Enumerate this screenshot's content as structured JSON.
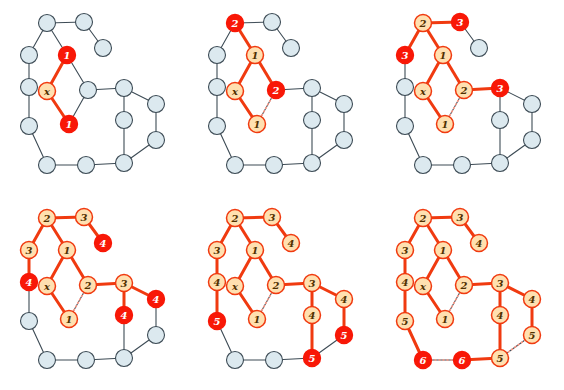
{
  "figure": {
    "panel_count": 6,
    "rows": 2,
    "cols": 3
  },
  "style": {
    "undiscovered_fill": "#dce9ef",
    "undiscovered_stroke": "#3d4b55",
    "discovered_fill": "#ffe0b0",
    "discovered_stroke": "#f03a10",
    "frontier_fill": "#f81807",
    "frontier_stroke": "#f81807",
    "frontier_text": "#ffffff",
    "label_text": "#503000",
    "plain_edge": "#3d4b55",
    "tree_edge": "#f03a10",
    "cross_edge": "#ff9a88",
    "background": "#ffffff",
    "node_radius": 8.5,
    "plain_edge_width": 1.1,
    "tree_edge_width": 3.0,
    "cross_edge_width": 1.6,
    "cross_edge_dash": "1,3"
  },
  "graph": {
    "note": "Shared node layout used by all six panels. Coordinates are panel-local pixels.",
    "nodes": [
      {
        "id": "a",
        "x": 47,
        "y": 23
      },
      {
        "id": "b",
        "x": 84,
        "y": 22
      },
      {
        "id": "c",
        "x": 103,
        "y": 48
      },
      {
        "id": "d",
        "x": 67,
        "y": 55
      },
      {
        "id": "e",
        "x": 29,
        "y": 55
      },
      {
        "id": "f",
        "x": 29,
        "y": 87
      },
      {
        "id": "x",
        "x": 47,
        "y": 91
      },
      {
        "id": "h",
        "x": 88,
        "y": 90
      },
      {
        "id": "i",
        "x": 69,
        "y": 124
      },
      {
        "id": "j",
        "x": 29,
        "y": 126
      },
      {
        "id": "k",
        "x": 124,
        "y": 88
      },
      {
        "id": "l",
        "x": 156,
        "y": 104
      },
      {
        "id": "m",
        "x": 124,
        "y": 120
      },
      {
        "id": "n",
        "x": 156,
        "y": 140
      },
      {
        "id": "o",
        "x": 47,
        "y": 165
      },
      {
        "id": "p",
        "x": 86,
        "y": 165
      },
      {
        "id": "q",
        "x": 124,
        "y": 163
      }
    ],
    "edges": [
      {
        "u": "a",
        "v": "b"
      },
      {
        "u": "a",
        "v": "d"
      },
      {
        "u": "a",
        "v": "e"
      },
      {
        "u": "b",
        "v": "c"
      },
      {
        "u": "d",
        "v": "x"
      },
      {
        "u": "d",
        "v": "h"
      },
      {
        "u": "e",
        "v": "f"
      },
      {
        "u": "f",
        "v": "j"
      },
      {
        "u": "x",
        "v": "i"
      },
      {
        "u": "h",
        "v": "i"
      },
      {
        "u": "h",
        "v": "k"
      },
      {
        "u": "k",
        "v": "l"
      },
      {
        "u": "k",
        "v": "m"
      },
      {
        "u": "l",
        "v": "n"
      },
      {
        "u": "m",
        "v": "q"
      },
      {
        "u": "n",
        "v": "q"
      },
      {
        "u": "j",
        "v": "o"
      },
      {
        "u": "o",
        "v": "p"
      },
      {
        "u": "p",
        "v": "q"
      }
    ]
  },
  "panels": [
    {
      "index": 1,
      "name": "panel-step-1",
      "caption": "",
      "labels": [
        {
          "node": "x",
          "text": "x",
          "state": "discovered"
        },
        {
          "node": "d",
          "text": "1",
          "state": "frontier"
        },
        {
          "node": "i",
          "text": "1",
          "state": "frontier"
        }
      ],
      "tree_edges": [
        [
          "x",
          "d"
        ],
        [
          "x",
          "i"
        ]
      ],
      "cross_edges": []
    },
    {
      "index": 2,
      "name": "panel-step-2",
      "caption": "",
      "labels": [
        {
          "node": "x",
          "text": "x",
          "state": "discovered"
        },
        {
          "node": "d",
          "text": "1",
          "state": "discovered"
        },
        {
          "node": "i",
          "text": "1",
          "state": "discovered"
        },
        {
          "node": "a",
          "text": "2",
          "state": "frontier"
        },
        {
          "node": "h",
          "text": "2",
          "state": "frontier"
        }
      ],
      "tree_edges": [
        [
          "x",
          "d"
        ],
        [
          "x",
          "i"
        ],
        [
          "d",
          "a"
        ],
        [
          "d",
          "h"
        ]
      ],
      "cross_edges": [
        [
          "h",
          "i"
        ]
      ]
    },
    {
      "index": 3,
      "name": "panel-step-3",
      "caption": "",
      "labels": [
        {
          "node": "x",
          "text": "x",
          "state": "discovered"
        },
        {
          "node": "d",
          "text": "1",
          "state": "discovered"
        },
        {
          "node": "i",
          "text": "1",
          "state": "discovered"
        },
        {
          "node": "a",
          "text": "2",
          "state": "discovered"
        },
        {
          "node": "h",
          "text": "2",
          "state": "discovered"
        },
        {
          "node": "b",
          "text": "3",
          "state": "frontier"
        },
        {
          "node": "e",
          "text": "3",
          "state": "frontier"
        },
        {
          "node": "k",
          "text": "3",
          "state": "frontier"
        }
      ],
      "tree_edges": [
        [
          "x",
          "d"
        ],
        [
          "x",
          "i"
        ],
        [
          "d",
          "a"
        ],
        [
          "d",
          "h"
        ],
        [
          "a",
          "b"
        ],
        [
          "a",
          "e"
        ],
        [
          "h",
          "k"
        ]
      ],
      "cross_edges": [
        [
          "h",
          "i"
        ]
      ]
    },
    {
      "index": 4,
      "name": "panel-step-4",
      "caption": "",
      "labels": [
        {
          "node": "x",
          "text": "x",
          "state": "discovered"
        },
        {
          "node": "d",
          "text": "1",
          "state": "discovered"
        },
        {
          "node": "i",
          "text": "1",
          "state": "discovered"
        },
        {
          "node": "a",
          "text": "2",
          "state": "discovered"
        },
        {
          "node": "h",
          "text": "2",
          "state": "discovered"
        },
        {
          "node": "b",
          "text": "3",
          "state": "discovered"
        },
        {
          "node": "e",
          "text": "3",
          "state": "discovered"
        },
        {
          "node": "k",
          "text": "3",
          "state": "discovered"
        },
        {
          "node": "c",
          "text": "4",
          "state": "frontier"
        },
        {
          "node": "f",
          "text": "4",
          "state": "frontier"
        },
        {
          "node": "m",
          "text": "4",
          "state": "frontier"
        },
        {
          "node": "l",
          "text": "4",
          "state": "frontier"
        }
      ],
      "tree_edges": [
        [
          "x",
          "d"
        ],
        [
          "x",
          "i"
        ],
        [
          "d",
          "a"
        ],
        [
          "d",
          "h"
        ],
        [
          "a",
          "b"
        ],
        [
          "a",
          "e"
        ],
        [
          "h",
          "k"
        ],
        [
          "b",
          "c"
        ],
        [
          "e",
          "f"
        ],
        [
          "k",
          "m"
        ],
        [
          "k",
          "l"
        ]
      ],
      "cross_edges": [
        [
          "h",
          "i"
        ]
      ]
    },
    {
      "index": 5,
      "name": "panel-step-5",
      "caption": "",
      "labels": [
        {
          "node": "x",
          "text": "x",
          "state": "discovered"
        },
        {
          "node": "d",
          "text": "1",
          "state": "discovered"
        },
        {
          "node": "i",
          "text": "1",
          "state": "discovered"
        },
        {
          "node": "a",
          "text": "2",
          "state": "discovered"
        },
        {
          "node": "h",
          "text": "2",
          "state": "discovered"
        },
        {
          "node": "b",
          "text": "3",
          "state": "discovered"
        },
        {
          "node": "e",
          "text": "3",
          "state": "discovered"
        },
        {
          "node": "k",
          "text": "3",
          "state": "discovered"
        },
        {
          "node": "c",
          "text": "4",
          "state": "discovered"
        },
        {
          "node": "f",
          "text": "4",
          "state": "discovered"
        },
        {
          "node": "m",
          "text": "4",
          "state": "discovered"
        },
        {
          "node": "l",
          "text": "4",
          "state": "discovered"
        },
        {
          "node": "j",
          "text": "5",
          "state": "frontier"
        },
        {
          "node": "q",
          "text": "5",
          "state": "frontier"
        },
        {
          "node": "n",
          "text": "5",
          "state": "frontier"
        }
      ],
      "tree_edges": [
        [
          "x",
          "d"
        ],
        [
          "x",
          "i"
        ],
        [
          "d",
          "a"
        ],
        [
          "d",
          "h"
        ],
        [
          "a",
          "b"
        ],
        [
          "a",
          "e"
        ],
        [
          "h",
          "k"
        ],
        [
          "b",
          "c"
        ],
        [
          "e",
          "f"
        ],
        [
          "k",
          "m"
        ],
        [
          "k",
          "l"
        ],
        [
          "f",
          "j"
        ],
        [
          "m",
          "q"
        ],
        [
          "l",
          "n"
        ]
      ],
      "cross_edges": [
        [
          "h",
          "i"
        ]
      ]
    },
    {
      "index": 6,
      "name": "panel-step-6",
      "caption": "",
      "labels": [
        {
          "node": "x",
          "text": "x",
          "state": "discovered"
        },
        {
          "node": "d",
          "text": "1",
          "state": "discovered"
        },
        {
          "node": "i",
          "text": "1",
          "state": "discovered"
        },
        {
          "node": "a",
          "text": "2",
          "state": "discovered"
        },
        {
          "node": "h",
          "text": "2",
          "state": "discovered"
        },
        {
          "node": "b",
          "text": "3",
          "state": "discovered"
        },
        {
          "node": "e",
          "text": "3",
          "state": "discovered"
        },
        {
          "node": "k",
          "text": "3",
          "state": "discovered"
        },
        {
          "node": "c",
          "text": "4",
          "state": "discovered"
        },
        {
          "node": "f",
          "text": "4",
          "state": "discovered"
        },
        {
          "node": "m",
          "text": "4",
          "state": "discovered"
        },
        {
          "node": "l",
          "text": "4",
          "state": "discovered"
        },
        {
          "node": "j",
          "text": "5",
          "state": "discovered"
        },
        {
          "node": "q",
          "text": "5",
          "state": "discovered"
        },
        {
          "node": "n",
          "text": "5",
          "state": "discovered"
        },
        {
          "node": "o",
          "text": "6",
          "state": "frontier"
        },
        {
          "node": "p",
          "text": "6",
          "state": "frontier"
        }
      ],
      "tree_edges": [
        [
          "x",
          "d"
        ],
        [
          "x",
          "i"
        ],
        [
          "d",
          "a"
        ],
        [
          "d",
          "h"
        ],
        [
          "a",
          "b"
        ],
        [
          "a",
          "e"
        ],
        [
          "h",
          "k"
        ],
        [
          "b",
          "c"
        ],
        [
          "e",
          "f"
        ],
        [
          "k",
          "m"
        ],
        [
          "k",
          "l"
        ],
        [
          "f",
          "j"
        ],
        [
          "m",
          "q"
        ],
        [
          "l",
          "n"
        ],
        [
          "j",
          "o"
        ],
        [
          "p",
          "q"
        ]
      ],
      "cross_edges": [
        [
          "h",
          "i"
        ],
        [
          "o",
          "p"
        ],
        [
          "n",
          "q"
        ]
      ]
    }
  ],
  "chart_data": {
    "type": "diagram",
    "source_node": "x",
    "levels": {
      "0": [
        "x"
      ],
      "1": [
        "d",
        "i"
      ],
      "2": [
        "a",
        "h"
      ],
      "3": [
        "b",
        "e",
        "k"
      ],
      "4": [
        "c",
        "f",
        "m",
        "l"
      ],
      "5": [
        "j",
        "q",
        "n"
      ],
      "6": [
        "o",
        "p"
      ]
    },
    "frontier_per_panel": [
      {
        "panel": 1,
        "level": 1,
        "labels": [
          "1",
          "1"
        ]
      },
      {
        "panel": 2,
        "level": 2,
        "labels": [
          "2",
          "2"
        ]
      },
      {
        "panel": 3,
        "level": 3,
        "labels": [
          "3",
          "3",
          "3"
        ]
      },
      {
        "panel": 4,
        "level": 4,
        "labels": [
          "4",
          "4",
          "4",
          "4"
        ]
      },
      {
        "panel": 5,
        "level": 5,
        "labels": [
          "5",
          "5",
          "5"
        ]
      },
      {
        "panel": 6,
        "level": 6,
        "labels": [
          "6",
          "6"
        ]
      }
    ],
    "node_count": 17,
    "edge_count": 19
  }
}
